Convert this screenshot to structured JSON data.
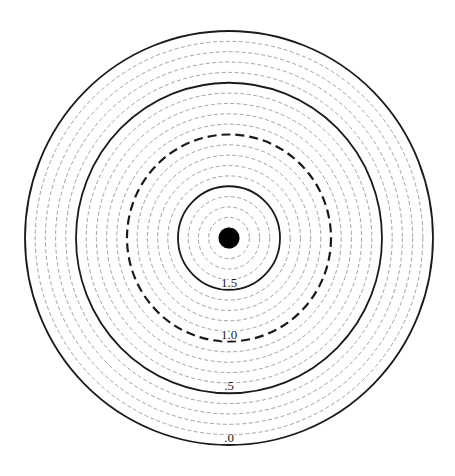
{
  "diagram": {
    "type": "concentric-ring-target",
    "ring_count": 20,
    "rings": [
      {
        "index": 1,
        "style": "thin-dashed"
      },
      {
        "index": 2,
        "style": "thin-dashed"
      },
      {
        "index": 3,
        "style": "thin-dashed"
      },
      {
        "index": 4,
        "style": "thin-dashed"
      },
      {
        "index": 5,
        "style": "solid",
        "label": "1.5"
      },
      {
        "index": 6,
        "style": "thin-dashed"
      },
      {
        "index": 7,
        "style": "thin-dashed"
      },
      {
        "index": 8,
        "style": "thin-dashed"
      },
      {
        "index": 9,
        "style": "thin-dashed"
      },
      {
        "index": 10,
        "style": "thick-dashed",
        "label": "1.0"
      },
      {
        "index": 11,
        "style": "thin-dashed"
      },
      {
        "index": 12,
        "style": "thin-dashed"
      },
      {
        "index": 13,
        "style": "thin-dashed"
      },
      {
        "index": 14,
        "style": "thin-dashed"
      },
      {
        "index": 15,
        "style": "solid",
        "label": ".5"
      },
      {
        "index": 16,
        "style": "thin-dashed"
      },
      {
        "index": 17,
        "style": "thin-dashed"
      },
      {
        "index": 18,
        "style": "thin-dashed"
      },
      {
        "index": 19,
        "style": "thin-dashed"
      },
      {
        "index": 20,
        "style": "solid",
        "label": ".0"
      }
    ],
    "center_mark": "filled-dot",
    "colors": {
      "solid": "#1a1a1a",
      "thick_dashed": "#1a1a1a",
      "thin_dashed": "#8a8a8a",
      "dot": "#000000",
      "background": "#ffffff"
    }
  }
}
